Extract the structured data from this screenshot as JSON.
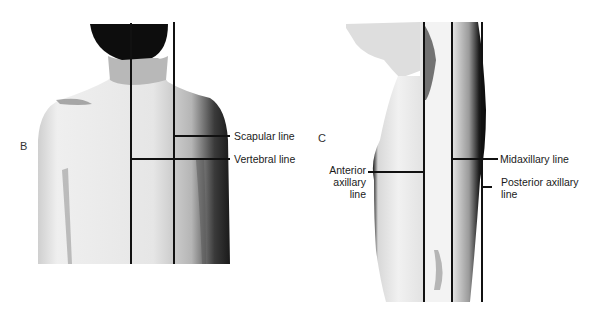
{
  "panels": [
    {
      "id": "B",
      "letter": "B",
      "view": "posterior",
      "labels": {
        "scapular": "Scapular line",
        "vertebral": "Vertebral line"
      }
    },
    {
      "id": "C",
      "letter": "C",
      "view": "lateral",
      "labels": {
        "anterior_line1": "Anterior",
        "anterior_line2": "axillary",
        "anterior_line3": "line",
        "midaxillary": "Midaxillary line",
        "posterior_line1": "Posterior axillary",
        "posterior_line2": "line"
      }
    }
  ],
  "colors": {
    "line": "#111111",
    "background": "#ffffff",
    "skin_light": "#e9e9e9",
    "skin_shadow": "#2a2a2a"
  }
}
